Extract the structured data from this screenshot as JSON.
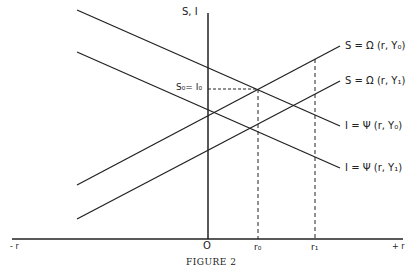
{
  "figure": {
    "caption": "FIGURE 2",
    "y_axis_label": "S, I",
    "origin_label": "O",
    "x_neg_label": "- r",
    "x_pos_label": "+ r",
    "equilibrium_label": "S₀= I₀",
    "r_ticks": [
      {
        "label": "r₀",
        "x": 258
      },
      {
        "label": "r₁",
        "x": 315
      }
    ],
    "curves": [
      {
        "id": "S0",
        "label": "S = Ω (r, Y₀)",
        "type": "saving",
        "slope": "upward"
      },
      {
        "id": "S1",
        "label": "S = Ω (r, Y₁)",
        "type": "saving",
        "slope": "upward"
      },
      {
        "id": "I0",
        "label": "I = Ψ (r, Y₀)",
        "type": "investment",
        "slope": "downward"
      },
      {
        "id": "I1",
        "label": "I = Ψ (r, Y₁)",
        "type": "investment",
        "slope": "downward"
      }
    ]
  }
}
